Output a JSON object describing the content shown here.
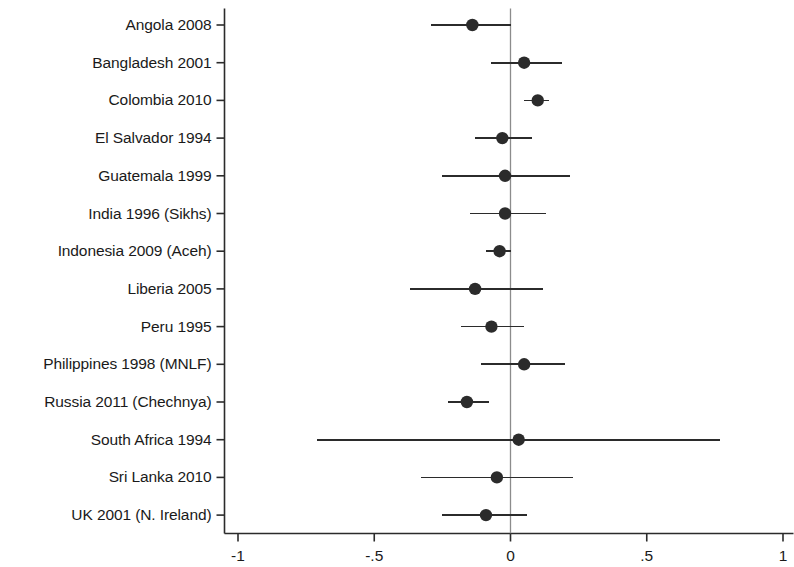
{
  "chart_data": {
    "type": "scatter",
    "subtype": "forest-plot",
    "title": "",
    "xlabel": "",
    "ylabel": "",
    "xlim": [
      -1,
      1
    ],
    "xticks": [
      -1,
      -0.5,
      0,
      0.5,
      1
    ],
    "xticklabels": [
      "-1",
      "-.5",
      "0",
      ".5",
      "1"
    ],
    "grid": false,
    "legend": null,
    "reference_line": 0,
    "categories": [
      "Angola 2008",
      "Bangladesh 2001",
      "Colombia 2010",
      "El Salvador 1994",
      "Guatemala 1999",
      "India 1996 (Sikhs)",
      "Indonesia 2009 (Aceh)",
      "Liberia 2005",
      "Peru 1995",
      "Philippines 1998 (MNLF)",
      "Russia 2011 (Chechnya)",
      "South Africa 1994",
      "Sri Lanka 2010",
      "UK 2001 (N. Ireland)"
    ],
    "estimates": [
      -0.14,
      0.05,
      0.1,
      -0.03,
      -0.02,
      -0.02,
      -0.04,
      -0.13,
      -0.07,
      0.05,
      -0.16,
      0.03,
      -0.05,
      -0.09
    ],
    "ci_low": [
      -0.29,
      -0.07,
      0.05,
      -0.13,
      -0.25,
      -0.15,
      -0.09,
      -0.37,
      -0.18,
      -0.11,
      -0.23,
      -0.71,
      -0.33,
      -0.25
    ],
    "ci_high": [
      0.0,
      0.19,
      0.14,
      0.08,
      0.22,
      0.13,
      0.0,
      0.12,
      0.05,
      0.2,
      -0.08,
      0.77,
      0.23,
      0.06
    ],
    "point_color": "#2b2b2b",
    "line_color": "#2b2b2b",
    "axis_color": "#2b2b2b",
    "reference_line_color": "#8c8c8c"
  }
}
